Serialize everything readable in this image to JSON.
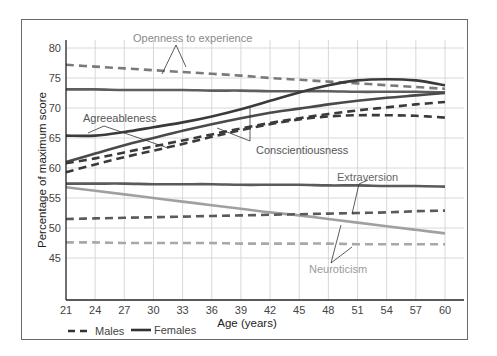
{
  "chart_data": {
    "type": "line",
    "title": "",
    "xlabel": "Age (years)",
    "ylabel": "Percentage of maximum score",
    "x_ticks": [
      21,
      24,
      27,
      30,
      33,
      36,
      39,
      42,
      45,
      48,
      51,
      54,
      57,
      60
    ],
    "y_ticks": [
      45,
      50,
      55,
      60,
      65,
      70,
      75,
      80
    ],
    "xlim": [
      21,
      60
    ],
    "ylim": [
      40,
      82
    ],
    "grid": true,
    "legend": {
      "position": "bottom-left",
      "entries": [
        {
          "label": "Males",
          "style": "dashed"
        },
        {
          "label": "Females",
          "style": "solid"
        }
      ]
    },
    "x": [
      21,
      24,
      27,
      30,
      33,
      36,
      39,
      42,
      45,
      48,
      51,
      54,
      57,
      60
    ],
    "series": [
      {
        "name": "Openness to experience - Males",
        "trait": "Openness to experience",
        "sex": "Males",
        "style": "dashed",
        "color": "#7a7a7a",
        "values": [
          77.2,
          76.9,
          76.6,
          76.3,
          76.0,
          75.7,
          75.4,
          75.0,
          74.7,
          74.4,
          74.1,
          73.8,
          73.5,
          73.2
        ]
      },
      {
        "name": "Openness to experience - Females",
        "trait": "Openness to experience",
        "sex": "Females",
        "style": "solid",
        "color": "#5e5e5e",
        "values": [
          73.1,
          73.1,
          73.0,
          73.0,
          73.0,
          72.9,
          72.9,
          72.8,
          72.8,
          72.8,
          72.7,
          72.7,
          72.7,
          72.6
        ]
      },
      {
        "name": "Agreeableness - Females",
        "trait": "Agreeableness",
        "sex": "Females",
        "style": "solid",
        "color": "#3a3a3a",
        "values": [
          65.4,
          65.4,
          66.0,
          66.8,
          67.6,
          68.6,
          69.8,
          71.2,
          72.6,
          73.8,
          74.6,
          74.8,
          74.6,
          73.8
        ]
      },
      {
        "name": "Conscientiousness - Females",
        "trait": "Conscientiousness",
        "sex": "Females",
        "style": "solid",
        "color": "#4a4a4a",
        "values": [
          61.0,
          62.4,
          63.8,
          65.0,
          66.2,
          67.3,
          68.3,
          69.2,
          69.9,
          70.6,
          71.2,
          71.7,
          72.1,
          72.5
        ]
      },
      {
        "name": "Agreeableness - Males",
        "trait": "Agreeableness",
        "sex": "Males",
        "style": "dashed",
        "color": "#3a3a3a",
        "values": [
          60.8,
          61.6,
          62.6,
          63.6,
          64.6,
          65.6,
          66.6,
          67.5,
          68.3,
          69.0,
          69.6,
          70.1,
          70.6,
          71.0
        ]
      },
      {
        "name": "Conscientiousness - Males",
        "trait": "Conscientiousness",
        "sex": "Males",
        "style": "dashed",
        "color": "#3a3a3a",
        "values": [
          59.3,
          60.6,
          61.8,
          62.9,
          64.0,
          65.2,
          66.3,
          67.3,
          68.1,
          68.6,
          68.8,
          68.8,
          68.7,
          68.4
        ]
      },
      {
        "name": "Extraversion - Females",
        "trait": "Extraversion",
        "sex": "Females",
        "style": "solid",
        "color": "#5a5a5a",
        "values": [
          57.4,
          57.4,
          57.4,
          57.3,
          57.3,
          57.3,
          57.2,
          57.2,
          57.2,
          57.1,
          57.1,
          57.0,
          57.0,
          56.9
        ]
      },
      {
        "name": "Neuroticism - Females",
        "trait": "Neuroticism",
        "sex": "Females",
        "style": "solid",
        "color": "#a0a0a0",
        "values": [
          56.8,
          56.2,
          55.6,
          55.0,
          54.4,
          53.8,
          53.2,
          52.6,
          52.1,
          51.5,
          50.9,
          50.3,
          49.7,
          49.1
        ]
      },
      {
        "name": "Extraversion - Males",
        "trait": "Extraversion",
        "sex": "Males",
        "style": "dashed",
        "color": "#5a5a5a",
        "values": [
          51.5,
          51.6,
          51.7,
          51.8,
          51.9,
          52.0,
          52.1,
          52.2,
          52.3,
          52.4,
          52.5,
          52.6,
          52.8,
          52.9
        ]
      },
      {
        "name": "Neuroticism - Males",
        "trait": "Neuroticism",
        "sex": "Males",
        "style": "dashed",
        "color": "#a8a8a8",
        "values": [
          47.6,
          47.6,
          47.5,
          47.5,
          47.5,
          47.5,
          47.4,
          47.4,
          47.4,
          47.4,
          47.3,
          47.3,
          47.3,
          47.3
        ]
      }
    ],
    "annotations": [
      {
        "text": "Openness to experience",
        "color": "#8a8a8a"
      },
      {
        "text": "Agreeableness",
        "color": "#555555"
      },
      {
        "text": "Conscientiousness",
        "color": "#555555"
      },
      {
        "text": "Extraversion",
        "color": "#666666"
      },
      {
        "text": "Neuroticism",
        "color": "#9a9a9a"
      }
    ]
  },
  "labels": {
    "xlabel": "Age (years)",
    "ylabel": "Percentage of maximum score",
    "legend_males": "Males",
    "legend_females": "Females",
    "ann_openness": "Openness to experience",
    "ann_agreeableness": "Agreeableness",
    "ann_conscientiousness": "Conscientiousness",
    "ann_extraversion": "Extraversion",
    "ann_neuroticism": "Neuroticism"
  }
}
